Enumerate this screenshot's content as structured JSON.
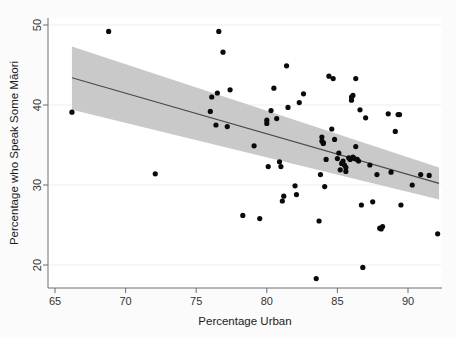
{
  "figure": {
    "background_color": "#fbfbfb",
    "plot_background_color": "#ffffff",
    "axis_color": "#6e6e6e",
    "point_color": "#0a0a0a",
    "band_color": "#c9c9c9",
    "line_color": "#4a4a4a"
  },
  "chart_data": {
    "type": "scatter",
    "title": "",
    "subtitle": "",
    "xlabel": "Percentage Urban",
    "ylabel": "Percentage who Speak Some Māori",
    "xlim": [
      64.0,
      92.8
    ],
    "ylim": [
      17.6,
      50.6
    ],
    "xticks": [
      65,
      70,
      75,
      80,
      85,
      90
    ],
    "xticklabels": [
      "65",
      "70",
      "75",
      "80",
      "85",
      "90"
    ],
    "yticks": [
      20,
      30,
      40,
      50
    ],
    "yticklabels": [
      "20",
      "30",
      "40",
      "50"
    ],
    "grid": "light horizontal gridlines at y ticks",
    "legend": "none",
    "annotations": [],
    "series": [
      {
        "name": "Territorial authorities",
        "type": "scatter",
        "marker": "filled circle",
        "points": [
          [
            66.2,
            39.1
          ],
          [
            68.8,
            49.2
          ],
          [
            72.1,
            31.4
          ],
          [
            76.0,
            39.2
          ],
          [
            76.1,
            41.0
          ],
          [
            76.4,
            37.5
          ],
          [
            76.5,
            41.5
          ],
          [
            76.6,
            49.2
          ],
          [
            76.9,
            46.6
          ],
          [
            77.2,
            37.3
          ],
          [
            77.4,
            41.9
          ],
          [
            78.3,
            26.2
          ],
          [
            79.1,
            34.9
          ],
          [
            79.5,
            25.8
          ],
          [
            80.0,
            37.7
          ],
          [
            80.0,
            38.1
          ],
          [
            80.1,
            32.3
          ],
          [
            80.3,
            39.3
          ],
          [
            80.5,
            42.1
          ],
          [
            80.7,
            38.3
          ],
          [
            80.9,
            32.9
          ],
          [
            81.0,
            32.3
          ],
          [
            81.1,
            28.0
          ],
          [
            81.2,
            28.6
          ],
          [
            81.4,
            44.9
          ],
          [
            81.5,
            39.7
          ],
          [
            82.0,
            29.9
          ],
          [
            82.1,
            28.8
          ],
          [
            82.3,
            40.3
          ],
          [
            82.6,
            41.4
          ],
          [
            83.5,
            18.3
          ],
          [
            83.7,
            25.5
          ],
          [
            83.8,
            31.3
          ],
          [
            83.9,
            35.5
          ],
          [
            83.9,
            36.0
          ],
          [
            84.0,
            35.2
          ],
          [
            84.0,
            35.3
          ],
          [
            84.1,
            29.8
          ],
          [
            84.2,
            33.2
          ],
          [
            84.4,
            43.6
          ],
          [
            84.6,
            37.0
          ],
          [
            84.7,
            43.3
          ],
          [
            84.8,
            35.7
          ],
          [
            85.0,
            33.3
          ],
          [
            85.1,
            34.0
          ],
          [
            85.2,
            31.9
          ],
          [
            85.3,
            32.7
          ],
          [
            85.4,
            33.0
          ],
          [
            85.5,
            32.5
          ],
          [
            85.6,
            31.7
          ],
          [
            85.6,
            32.2
          ],
          [
            85.8,
            33.4
          ],
          [
            85.9,
            33.2
          ],
          [
            86.0,
            41.0
          ],
          [
            86.0,
            40.6
          ],
          [
            86.1,
            41.2
          ],
          [
            86.1,
            33.5
          ],
          [
            86.2,
            33.3
          ],
          [
            86.3,
            34.8
          ],
          [
            86.3,
            43.3
          ],
          [
            86.4,
            33.2
          ],
          [
            86.5,
            33.0
          ],
          [
            86.6,
            39.4
          ],
          [
            86.7,
            27.5
          ],
          [
            86.8,
            19.7
          ],
          [
            87.0,
            38.4
          ],
          [
            87.3,
            32.5
          ],
          [
            87.5,
            27.9
          ],
          [
            87.8,
            31.3
          ],
          [
            88.0,
            24.6
          ],
          [
            88.1,
            24.5
          ],
          [
            88.2,
            24.8
          ],
          [
            88.6,
            38.9
          ],
          [
            88.8,
            31.6
          ],
          [
            89.1,
            36.7
          ],
          [
            89.3,
            38.8
          ],
          [
            89.4,
            38.8
          ],
          [
            89.5,
            27.5
          ],
          [
            90.3,
            30.0
          ],
          [
            90.9,
            31.3
          ],
          [
            91.5,
            31.2
          ],
          [
            92.1,
            23.9
          ]
        ]
      },
      {
        "name": "Linear fit",
        "type": "line",
        "points": [
          [
            66.2,
            43.4
          ],
          [
            92.2,
            30.2
          ]
        ]
      },
      {
        "name": "95% confidence band",
        "type": "band",
        "upper": [
          [
            66.2,
            47.3
          ],
          [
            92.2,
            32.2
          ]
        ],
        "lower": [
          [
            66.2,
            39.4
          ],
          [
            92.2,
            28.2
          ]
        ]
      }
    ]
  }
}
